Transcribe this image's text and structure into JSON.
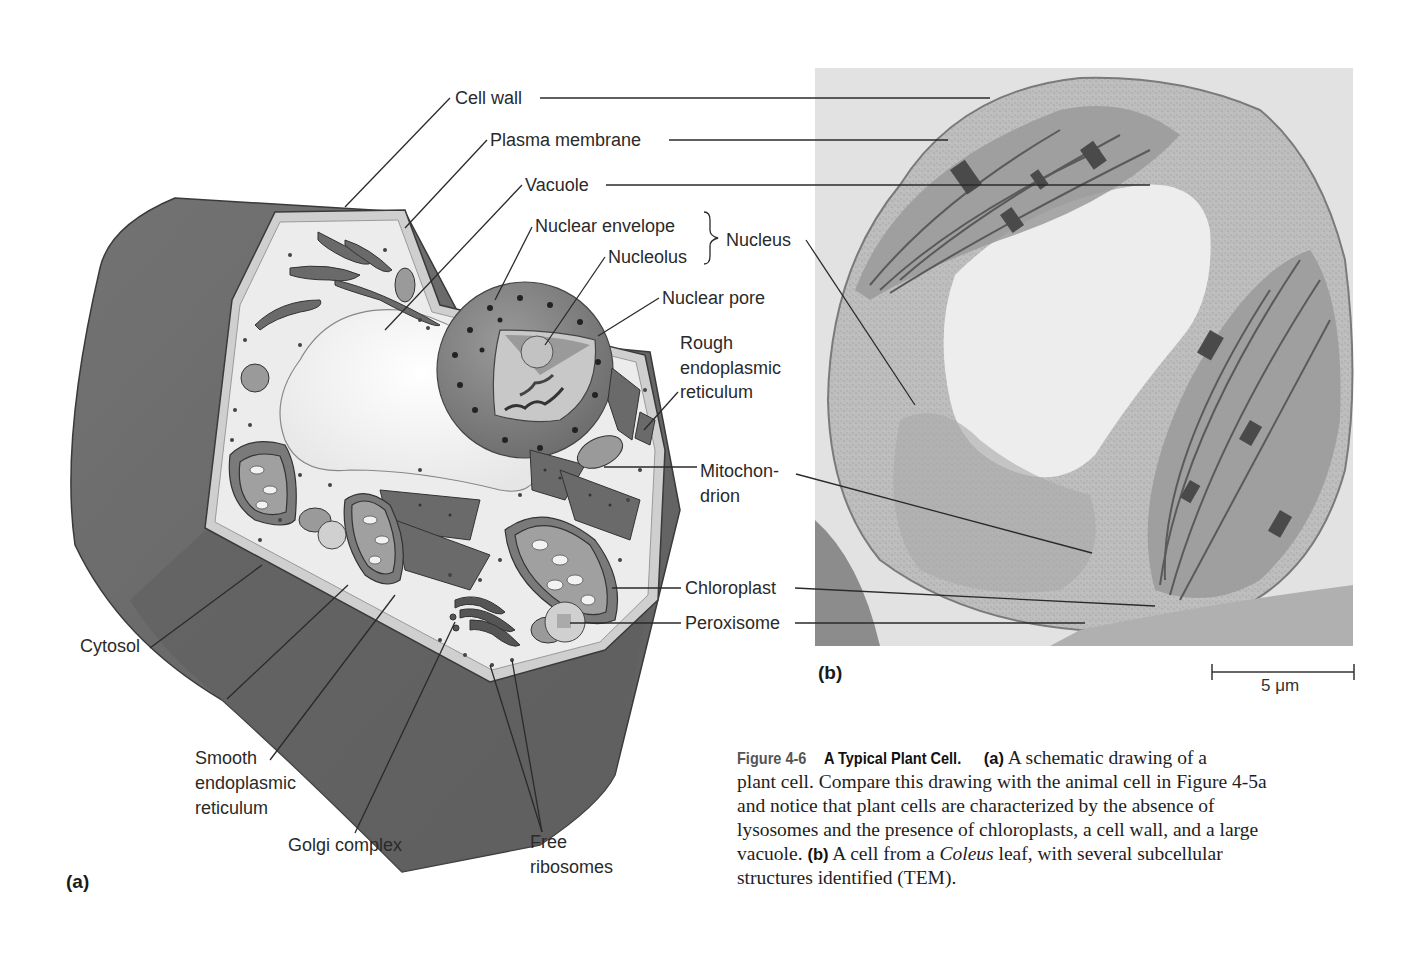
{
  "figure": {
    "number": "Figure 4-6",
    "title": "A Typical Plant Cell.",
    "panel_a_tag": "(a)",
    "panel_b_tag": "(b)",
    "caption": {
      "part_a_label": "(a)",
      "part_a_text_1": " A schematic drawing of a",
      "part_a_text_2": "plant cell. Compare this drawing with the animal cell in Figure 4-5a",
      "part_a_text_3": "and notice that plant cells are characterized by the absence of",
      "part_a_text_4": "lysosomes and the presence of chloroplasts, a cell wall, and a large",
      "part_a_text_5": "vacuole. ",
      "part_b_label": "(b)",
      "part_b_text_1": " A cell from a ",
      "part_b_italic": "Coleus",
      "part_b_text_2": " leaf, with several subcellular",
      "part_b_text_3": "structures identified (TEM)."
    }
  },
  "labels": {
    "cell_wall": "Cell wall",
    "plasma_membrane": "Plasma membrane",
    "vacuole": "Vacuole",
    "nuclear_envelope": "Nuclear envelope",
    "nucleolus": "Nucleolus",
    "nucleus": "Nucleus",
    "nuclear_pore": "Nuclear pore",
    "rough_er_1": "Rough",
    "rough_er_2": "endoplasmic",
    "rough_er_3": "reticulum",
    "mitochondrion_1": "Mitochon-",
    "mitochondrion_2": "drion",
    "chloroplast": "Chloroplast",
    "peroxisome": "Peroxisome",
    "cytosol": "Cytosol",
    "smooth_er_1": "Smooth",
    "smooth_er_2": "endoplasmic",
    "smooth_er_3": "reticulum",
    "golgi": "Golgi complex",
    "free_ribosomes_1": "Free",
    "free_ribosomes_2": "ribosomes"
  },
  "scale_bar": {
    "value": "5 μm"
  },
  "colors": {
    "outer_block": "#6e6e6e",
    "outer_block_dark": "#5c5c5c",
    "cell_wall_face": "#d4d4d4",
    "cytosol": "#ededed",
    "vacuole": "#f7f7f7",
    "organelle_dark": "#5a5a5a",
    "organelle_mid": "#8a8a8a",
    "tem_bg": "#c9c9c9",
    "tem_light": "#ececec",
    "leader_line": "#2a2a2a"
  }
}
